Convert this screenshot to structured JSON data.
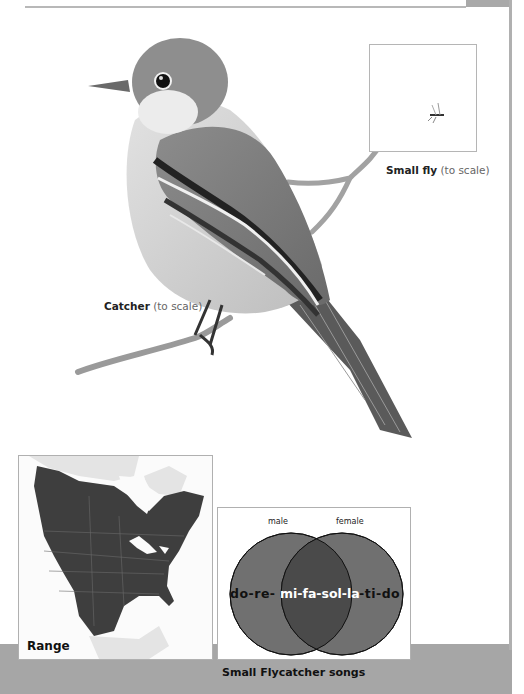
{
  "page": {
    "colors": {
      "band_gray": "#a6a6a6",
      "rule_gray": "#b8b8b8",
      "range_fill": "#3e3e3e",
      "land_outside": "#e4e4e4",
      "venn_circle": "#6f6f6f",
      "venn_overlap": "#4a4a4a"
    }
  },
  "bird": {
    "caption_bold": "Catcher",
    "caption_light": " (to scale)",
    "icon": "flycatcher-illustration"
  },
  "fly": {
    "caption_bold": "Small fly",
    "caption_light": " (to scale)",
    "icon": "fly-illustration"
  },
  "range_map": {
    "label": "Range",
    "icon": "north-america-range-map"
  },
  "venn": {
    "caption": "Small Flycatcher songs",
    "left_label": "male",
    "right_label": "female",
    "left_only": "do-re-",
    "overlap": "mi-fa-sol-la",
    "right_only": "-ti-do"
  }
}
